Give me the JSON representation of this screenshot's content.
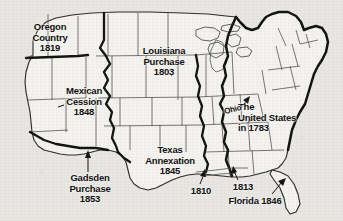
{
  "figure": {
    "kind": "historical-map",
    "background_color": "#e8e7e3",
    "land_color": "#f4f3f0",
    "ink_color": "#111111"
  },
  "labels": {
    "oregon": "Oregon\nCountry\n1819",
    "mexican_cession": "Mexican\nCession\n1848",
    "louisiana": "Louisiana\nPurchase\n1803",
    "texas": "Texas\nAnnexation\n1845",
    "gadsden": "Gadsden\nPurchase\n1853",
    "united_states_1783": "The\nUnited States\nin 1783",
    "ohio": "Ohio",
    "west_florida_1810": "1810",
    "mobile_1813": "1813",
    "florida_1846": "Florida 1846"
  },
  "territories": [
    {
      "name": "Oregon Country",
      "year": "1819"
    },
    {
      "name": "Mexican Cession",
      "year": "1848"
    },
    {
      "name": "Louisiana Purchase",
      "year": "1803"
    },
    {
      "name": "Texas Annexation",
      "year": "1845"
    },
    {
      "name": "Gadsden Purchase",
      "year": "1853"
    },
    {
      "name": "The United States in 1783",
      "year": "1783"
    },
    {
      "name": "West Florida",
      "year": "1810"
    },
    {
      "name": "Mobile District",
      "year": "1813"
    },
    {
      "name": "Florida",
      "year": "1846"
    },
    {
      "name": "Ohio",
      "year": ""
    }
  ]
}
